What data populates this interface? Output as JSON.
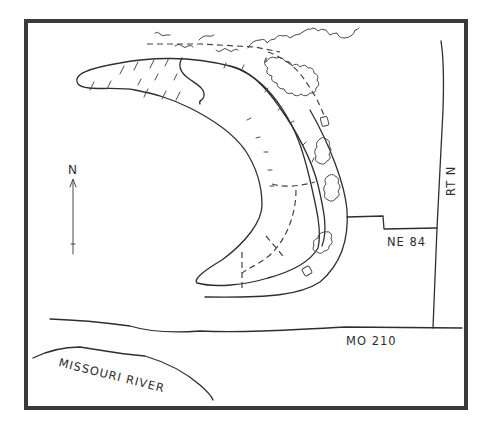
{
  "map": {
    "type": "hand-drawn site sketch",
    "colors": {
      "ink": "#2e2e2e",
      "frame": "#3a3a3a",
      "background": "#ffffff"
    },
    "north_arrow": {
      "label": "N",
      "icon": "north-arrow-icon"
    },
    "roads": [
      {
        "id": "rt-n",
        "label": "RT N",
        "orientation": "vertical"
      },
      {
        "id": "ne-84",
        "label": "NE 84",
        "orientation": "horizontal"
      },
      {
        "id": "mo-210",
        "label": "MO 210",
        "orientation": "horizontal"
      }
    ],
    "water": [
      {
        "id": "missouri-river",
        "label": "MISSOURI RIVER"
      }
    ],
    "features": [
      {
        "id": "oxbow-lake",
        "description": "crescent-shaped lake with marsh hatching"
      },
      {
        "id": "trail",
        "description": "dashed path along lake"
      },
      {
        "id": "tree-clusters",
        "count": 4
      },
      {
        "id": "structures",
        "count": 2
      }
    ]
  }
}
